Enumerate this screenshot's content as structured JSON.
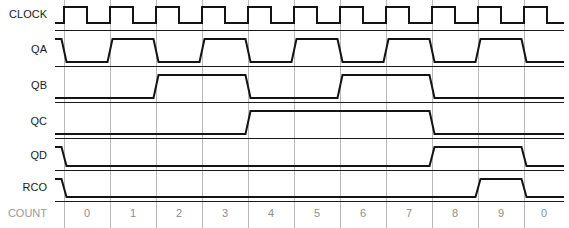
{
  "diagram": {
    "background_color": "#ffffff",
    "wave_color": "#141414",
    "grid_color": "#b9b9b9",
    "row_line_color": "#1a1a1a",
    "label_color": "#1a1a1a",
    "count_text_color": "#8d8d8d"
  },
  "axis": {
    "count_row_label": "COUNT",
    "label_column_right_x": 55,
    "wave_start_x": 64,
    "cell_width": 46,
    "cell_count": 10,
    "wave_end_x": 564,
    "edge_slew": 5
  },
  "signals": [
    {
      "name": "CLOCK",
      "label": "CLOCK",
      "row_index": 0,
      "y_high": 7,
      "y_low": 23,
      "baseline_y": 30,
      "initial_level": 0,
      "transitions": [
        {
          "x": 64,
          "level": 1
        },
        {
          "x": 87,
          "level": 0
        },
        {
          "x": 110,
          "level": 1
        },
        {
          "x": 133,
          "level": 0
        },
        {
          "x": 156,
          "level": 1
        },
        {
          "x": 179,
          "level": 0
        },
        {
          "x": 202,
          "level": 1
        },
        {
          "x": 225,
          "level": 0
        },
        {
          "x": 248,
          "level": 1
        },
        {
          "x": 271,
          "level": 0
        },
        {
          "x": 294,
          "level": 1
        },
        {
          "x": 317,
          "level": 0
        },
        {
          "x": 340,
          "level": 1
        },
        {
          "x": 363,
          "level": 0
        },
        {
          "x": 386,
          "level": 1
        },
        {
          "x": 409,
          "level": 0
        },
        {
          "x": 432,
          "level": 1
        },
        {
          "x": 455,
          "level": 0
        },
        {
          "x": 478,
          "level": 1
        },
        {
          "x": 501,
          "level": 0
        },
        {
          "x": 524,
          "level": 1
        },
        {
          "x": 547,
          "level": 0
        }
      ],
      "square_edges": true
    },
    {
      "name": "QA",
      "label": "QA",
      "row_index": 1,
      "y_high": 39,
      "y_low": 62,
      "baseline_y": 66,
      "initial_level": 1,
      "transitions": [
        {
          "x": 64,
          "level": 0
        },
        {
          "x": 110,
          "level": 1
        },
        {
          "x": 156,
          "level": 0
        },
        {
          "x": 202,
          "level": 1
        },
        {
          "x": 248,
          "level": 0
        },
        {
          "x": 294,
          "level": 1
        },
        {
          "x": 340,
          "level": 0
        },
        {
          "x": 386,
          "level": 1
        },
        {
          "x": 432,
          "level": 0
        },
        {
          "x": 478,
          "level": 1
        },
        {
          "x": 524,
          "level": 0
        }
      ],
      "square_edges": false
    },
    {
      "name": "QB",
      "label": "QB",
      "row_index": 2,
      "y_high": 75,
      "y_low": 98,
      "baseline_y": 102,
      "initial_level": 0,
      "transitions": [
        {
          "x": 156,
          "level": 1
        },
        {
          "x": 248,
          "level": 0
        },
        {
          "x": 340,
          "level": 1
        },
        {
          "x": 432,
          "level": 0
        }
      ],
      "square_edges": false
    },
    {
      "name": "QC",
      "label": "QC",
      "row_index": 3,
      "y_high": 111,
      "y_low": 134,
      "baseline_y": 138,
      "initial_level": 0,
      "transitions": [
        {
          "x": 248,
          "level": 1
        },
        {
          "x": 432,
          "level": 0
        }
      ],
      "square_edges": false
    },
    {
      "name": "QD",
      "label": "QD",
      "row_index": 4,
      "y_high": 147,
      "y_low": 166,
      "baseline_y": 170,
      "initial_level": 1,
      "transitions": [
        {
          "x": 64,
          "level": 0
        },
        {
          "x": 432,
          "level": 1
        },
        {
          "x": 524,
          "level": 0
        }
      ],
      "square_edges": false
    },
    {
      "name": "RCO",
      "label": "RCO",
      "row_index": 5,
      "y_high": 179,
      "y_low": 197,
      "baseline_y": 201,
      "initial_level": 1,
      "transitions": [
        {
          "x": 64,
          "level": 0
        },
        {
          "x": 478,
          "level": 1
        },
        {
          "x": 524,
          "level": 0
        }
      ],
      "square_edges": false
    }
  ],
  "count_row": {
    "label": "COUNT",
    "label_y": 214,
    "top_y": 201,
    "bottom_y": 228,
    "values": [
      "0",
      "1",
      "2",
      "3",
      "4",
      "5",
      "6",
      "7",
      "8",
      "9",
      "0"
    ]
  },
  "row_separator_y": [
    30,
    66,
    102,
    138,
    170,
    201
  ],
  "gridline_x": [
    64,
    110,
    156,
    202,
    248,
    294,
    340,
    386,
    432,
    478,
    524
  ],
  "grid_top_y": 0,
  "grid_bottom_y": 228
}
